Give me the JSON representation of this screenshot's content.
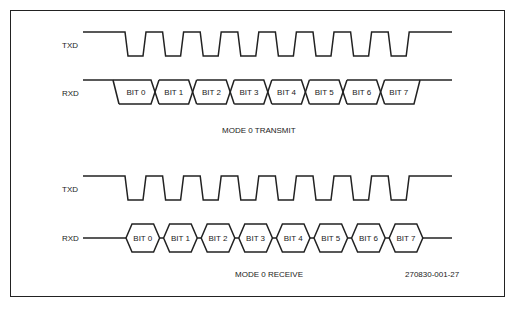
{
  "transmit": {
    "txd_label": "TXD",
    "rxd_label": "RXD",
    "caption": "MODE 0 TRANSMIT",
    "bits": [
      "BIT 0",
      "BIT 1",
      "BIT 2",
      "BIT 3",
      "BIT 4",
      "BIT 5",
      "BIT 6",
      "BIT 7"
    ]
  },
  "receive": {
    "txd_label": "TXD",
    "rxd_label": "RXD",
    "caption": "MODE 0 RECEIVE",
    "bits": [
      "BIT 0",
      "BIT 1",
      "BIT 2",
      "BIT 3",
      "BIT 4",
      "BIT 5",
      "BIT 6",
      "BIT 7"
    ]
  },
  "figure_id": "270830-001-27"
}
